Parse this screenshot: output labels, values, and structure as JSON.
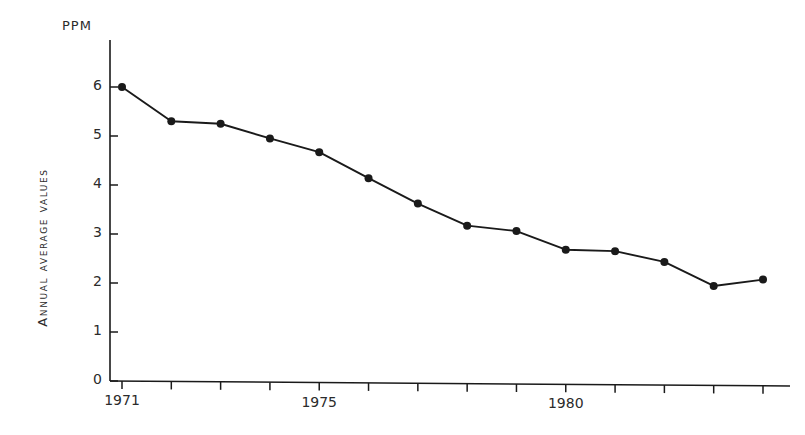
{
  "chart_data": {
    "type": "line",
    "title": "",
    "subtitle": "",
    "unit_label": "PPM",
    "ylabel": "Annual average values",
    "xlabel": "",
    "grid": false,
    "legend": false,
    "ylim": [
      0,
      6.4
    ],
    "xlim": [
      1970.7,
      1984.6
    ],
    "ytick_labels": [
      "0",
      "1",
      "2",
      "3",
      "4",
      "5",
      "6"
    ],
    "ytick_values": [
      0,
      1,
      2,
      3,
      4,
      5,
      6
    ],
    "xtick_values": [
      1971,
      1972,
      1973,
      1974,
      1975,
      1976,
      1977,
      1978,
      1979,
      1980,
      1981,
      1982,
      1983,
      1984
    ],
    "xtick_labels_shown": [
      "1971",
      "1975",
      "1980"
    ],
    "xtick_labels_shown_values": [
      1971,
      1975,
      1980
    ],
    "x": [
      1971,
      1972,
      1973,
      1974,
      1975,
      1976,
      1977,
      1978,
      1979,
      1980,
      1981,
      1982,
      1983,
      1984
    ],
    "values": [
      6.0,
      5.3,
      5.25,
      4.95,
      4.67,
      4.14,
      3.62,
      3.17,
      3.06,
      2.68,
      2.65,
      2.43,
      1.94,
      2.07
    ],
    "series": [
      {
        "name": "Annual average values",
        "values": [
          6.0,
          5.3,
          5.25,
          4.95,
          4.67,
          4.14,
          3.62,
          3.17,
          3.06,
          2.68,
          2.65,
          2.43,
          1.94,
          2.07
        ]
      }
    ],
    "marker": "filled-circle",
    "line_color": "#1a1a1a",
    "marker_color": "#1a1a1a",
    "axis_color": "#1a1a1a",
    "background": "#ffffff"
  }
}
